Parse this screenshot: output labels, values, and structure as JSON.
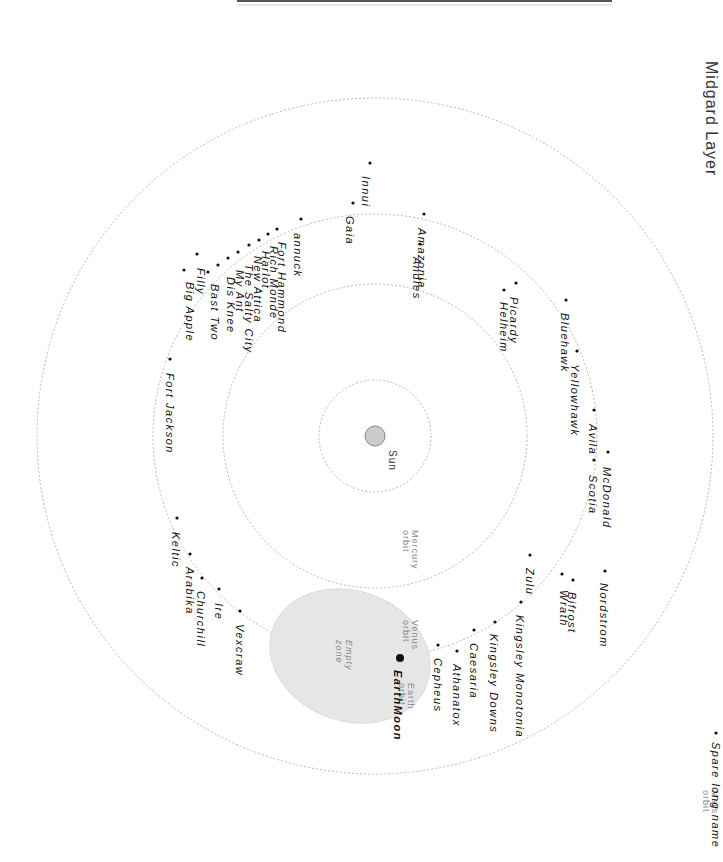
{
  "title": "Midgard Layer",
  "sun": {
    "label": "Sun",
    "x": 375,
    "y": 436,
    "r": 10,
    "fill": "#cccccc"
  },
  "orbits": [
    {
      "name": "Mercury orbit",
      "label_line1": "Mercury",
      "label_line2": "orbit",
      "r": 56,
      "lx": 412,
      "ly": 530
    },
    {
      "name": "Venus orbit",
      "label_line1": "Venus",
      "label_line2": "orbit",
      "r": 152,
      "lx": 412,
      "ly": 620
    },
    {
      "name": "Earth orbit",
      "label_line1": "Earth",
      "label_line2": "orbit",
      "r": 222,
      "lx": 408,
      "ly": 683
    },
    {
      "name": "Mars orbit",
      "label_line1": "Mars",
      "label_line2": "orbit",
      "r": 338,
      "lx": 712,
      "ly": 790
    }
  ],
  "empty_zone": {
    "label_line1": "Empty",
    "label_line2": "zone",
    "fill": "#e6e6e6"
  },
  "spare": {
    "label": "Spare long name",
    "x": 710,
    "y": 740
  },
  "colonies": [
    {
      "name": "Innui",
      "dx": 370,
      "dy": 163,
      "tx": 362,
      "ty": 176
    },
    {
      "name": "Gaia",
      "dx": 353,
      "dy": 203,
      "tx": 346,
      "ty": 216
    },
    {
      "name": "Amazonia",
      "dx": 424,
      "dy": 214,
      "tx": 418,
      "ty": 228
    },
    {
      "name": "Andies",
      "dx": 420,
      "dy": 244,
      "tx": 413,
      "ty": 257
    },
    {
      "name": "annuck",
      "dx": 301,
      "dy": 219,
      "tx": 294,
      "ty": 233
    },
    {
      "name": "Fort Hammond",
      "dx": 277,
      "dy": 229,
      "tx": 278,
      "ty": 242
    },
    {
      "name": "Rich Monde",
      "dx": 268,
      "dy": 234,
      "tx": 270,
      "ty": 246
    },
    {
      "name": "Harlot",
      "dx": 259,
      "dy": 240,
      "tx": 262,
      "ty": 251
    },
    {
      "name": "New Attica",
      "dx": 249,
      "dy": 245,
      "tx": 254,
      "ty": 256
    },
    {
      "name": "The Salty City",
      "dx": 238,
      "dy": 252,
      "tx": 245,
      "ty": 264
    },
    {
      "name": "My Ant",
      "dx": 228,
      "dy": 258,
      "tx": 236,
      "ty": 270
    },
    {
      "name": "Dis Knee",
      "dx": 218,
      "dy": 265,
      "tx": 227,
      "ty": 277
    },
    {
      "name": "Bast Two",
      "dx": 208,
      "dy": 272,
      "tx": 211,
      "ty": 284
    },
    {
      "name": "Filly",
      "dx": 197,
      "dy": 254,
      "tx": 197,
      "ty": 268
    },
    {
      "name": "Big Apple",
      "dx": 184,
      "dy": 270,
      "tx": 186,
      "ty": 282
    },
    {
      "name": "Fort Jackson",
      "dx": 170,
      "dy": 359,
      "tx": 166,
      "ty": 373
    },
    {
      "name": "Picardy",
      "dx": 516,
      "dy": 283,
      "tx": 510,
      "ty": 297
    },
    {
      "name": "Helheim",
      "dx": 504,
      "dy": 290,
      "tx": 500,
      "ty": 302
    },
    {
      "name": "Bluehawk",
      "dx": 566,
      "dy": 300,
      "tx": 561,
      "ty": 313
    },
    {
      "name": "Yellowhawk",
      "dx": 577,
      "dy": 351,
      "tx": 571,
      "ty": 364
    },
    {
      "name": "Avila",
      "dx": 594,
      "dy": 410,
      "tx": 589,
      "ty": 424
    },
    {
      "name": "McDonald",
      "dx": 608,
      "dy": 452,
      "tx": 603,
      "ty": 467
    },
    {
      "name": "Scotia",
      "dx": 594,
      "dy": 460,
      "tx": 589,
      "ty": 475
    },
    {
      "name": "Nordstrom",
      "dx": 605,
      "dy": 571,
      "tx": 600,
      "ty": 583
    },
    {
      "name": "Bifrost",
      "dx": 573,
      "dy": 580,
      "tx": 568,
      "ty": 592
    },
    {
      "name": "Wrath",
      "dx": 562,
      "dy": 574,
      "tx": 560,
      "ty": 590
    },
    {
      "name": "Zulu",
      "dx": 530,
      "dy": 555,
      "tx": 526,
      "ty": 568
    },
    {
      "name": "Kingsley Monotonia",
      "dx": 521,
      "dy": 602,
      "tx": 516,
      "ty": 615
    },
    {
      "name": "Kingsley Downs",
      "dx": 495,
      "dy": 622,
      "tx": 490,
      "ty": 634
    },
    {
      "name": "Caesaria",
      "dx": 474,
      "dy": 630,
      "tx": 470,
      "ty": 643
    },
    {
      "name": "Athanatox",
      "dx": 457,
      "dy": 651,
      "tx": 453,
      "ty": 664
    },
    {
      "name": "Cepheus",
      "dx": 438,
      "dy": 645,
      "tx": 434,
      "ty": 658
    },
    {
      "name": "EarthMoon",
      "dx": 400,
      "dy": 658,
      "tx": 394,
      "ty": 670,
      "bold": true,
      "big": true
    },
    {
      "name": "Vexcraw",
      "dx": 240,
      "dy": 611,
      "tx": 236,
      "ty": 624
    },
    {
      "name": "Ire",
      "dx": 219,
      "dy": 589,
      "tx": 215,
      "ty": 603
    },
    {
      "name": "Churchill",
      "dx": 202,
      "dy": 578,
      "tx": 197,
      "ty": 591
    },
    {
      "name": "Arabika",
      "dx": 190,
      "dy": 554,
      "tx": 186,
      "ty": 567
    },
    {
      "name": "Keltic",
      "dx": 177,
      "dy": 518,
      "tx": 172,
      "ty": 532
    }
  ]
}
